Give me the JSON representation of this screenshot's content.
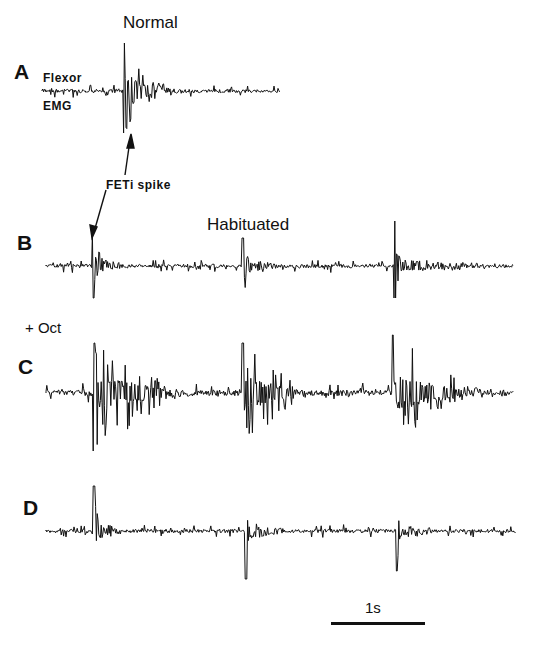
{
  "figure": {
    "panels": [
      {
        "letter": "A",
        "title": "Normal",
        "trace_label_top": "Flexor",
        "trace_label_bottom": "EMG"
      },
      {
        "letter": "B",
        "title": "Habituated"
      },
      {
        "letter": "C",
        "condition": "+ Oct"
      },
      {
        "letter": "D"
      }
    ],
    "annotation": "FETi spike",
    "scale_bar": {
      "label": "1s"
    },
    "colors": {
      "trace": "#111111",
      "background": "#ffffff"
    }
  },
  "traces": [
    {
      "id": "A",
      "x0": 42,
      "x1": 280,
      "y": 91,
      "noise": 3,
      "seed": 11,
      "bursts": [
        {
          "x": 123,
          "width": 28,
          "amp_up": 48,
          "amp_down": 42,
          "decay_width": 35,
          "decay_amp": 10
        }
      ]
    },
    {
      "id": "B",
      "x0": 46,
      "x1": 514,
      "y": 266,
      "noise": 3,
      "seed": 23,
      "bursts": [
        {
          "x": 92,
          "width": 10,
          "amp_up": 34,
          "amp_down": 32,
          "decay_width": 30,
          "decay_amp": 7
        },
        {
          "x": 242,
          "width": 10,
          "amp_up": 28,
          "amp_down": 32,
          "decay_width": 30,
          "decay_amp": 7
        },
        {
          "x": 394,
          "width": 10,
          "amp_up": 45,
          "amp_down": 32,
          "decay_width": 110,
          "decay_amp": 6
        }
      ]
    },
    {
      "id": "C",
      "x0": 46,
      "x1": 514,
      "y": 393,
      "noise": 5,
      "seed": 37,
      "bursts": [
        {
          "x": 93,
          "width": 72,
          "amp_up": 50,
          "amp_down": 58,
          "decay_width": 30,
          "decay_amp": 6
        },
        {
          "x": 242,
          "width": 50,
          "amp_up": 50,
          "amp_down": 56,
          "decay_width": 30,
          "decay_amp": 6
        },
        {
          "x": 392,
          "width": 70,
          "amp_up": 58,
          "amp_down": 50,
          "decay_width": 60,
          "decay_amp": 6
        }
      ]
    },
    {
      "id": "D",
      "x0": 46,
      "x1": 516,
      "y": 531,
      "noise": 3,
      "seed": 51,
      "bursts": [
        {
          "x": 93,
          "width": 6,
          "amp_up": 45,
          "amp_down": 50,
          "decay_width": 35,
          "decay_amp": 8
        },
        {
          "x": 245,
          "width": 6,
          "amp_up": 42,
          "amp_down": 48,
          "decay_width": 40,
          "decay_amp": 8
        },
        {
          "x": 396,
          "width": 6,
          "amp_up": 40,
          "amp_down": 40,
          "decay_width": 40,
          "decay_amp": 9
        }
      ]
    }
  ]
}
